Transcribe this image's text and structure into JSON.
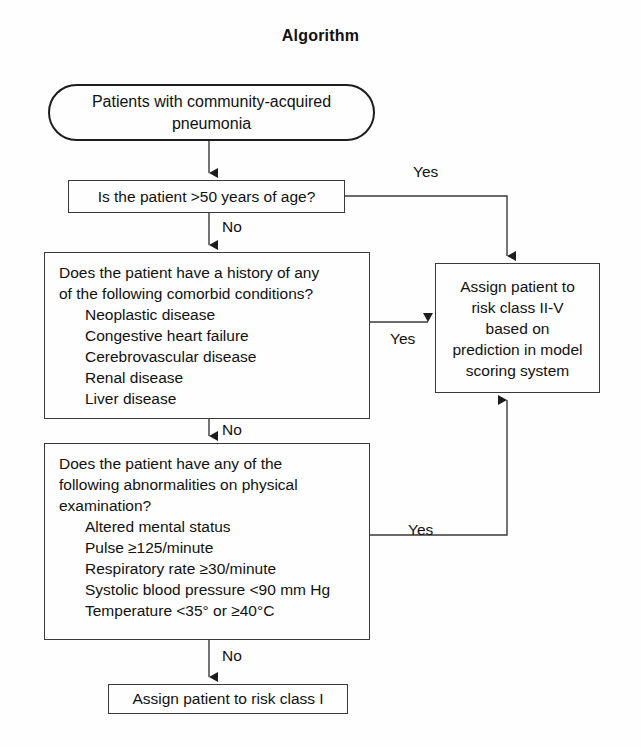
{
  "page": {
    "title": "Algorithm",
    "background_color": "#fefefe",
    "line_color": "#3a3a3a",
    "text_color": "#111111"
  },
  "nodes": {
    "start": {
      "shape": "stadium",
      "text": "Patients with community-acquired\npneumonia"
    },
    "age_decision": {
      "shape": "rectangle",
      "text": "Is the patient >50 years of age?"
    },
    "comorbid_decision": {
      "shape": "rectangle",
      "question": "Does the patient have a history of any\nof the following comorbid conditions?",
      "items": [
        "Neoplastic disease",
        "Congestive heart failure",
        "Cerebrovascular disease",
        "Renal disease",
        "Liver disease"
      ]
    },
    "exam_decision": {
      "shape": "rectangle",
      "question": "Does the patient have any of the\nfollowing abnormalities on physical\nexamination?",
      "items": [
        "Altered mental status",
        "Pulse ≥125/minute",
        "Respiratory rate ≥30/minute",
        "Systolic blood pressure <90 mm Hg",
        "Temperature <35° or ≥40°C"
      ]
    },
    "risk_class_2_5": {
      "shape": "rectangle",
      "text": "Assign patient to\nrisk class II-V\nbased on\nprediction in model\nscoring system"
    },
    "risk_class_1": {
      "shape": "rectangle",
      "text": "Assign patient to risk class I"
    }
  },
  "edges": {
    "yes_from_age": "Yes",
    "yes_from_comorbid": "Yes",
    "yes_from_exam": "Yes",
    "no_from_age": "No",
    "no_from_comorbid": "No",
    "no_from_exam": "No"
  }
}
